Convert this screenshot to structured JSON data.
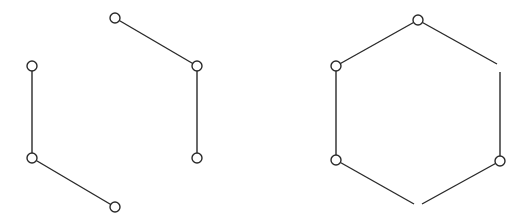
{
  "diagram": {
    "type": "graph",
    "stroke_color": "#2a2a2a",
    "node_radius": 5,
    "graphs": [
      {
        "name": "left-graph-three-disjoint-edges",
        "nodes": [
          {
            "id": "L1",
            "x": 115,
            "y": 18
          },
          {
            "id": "L2",
            "x": 197,
            "y": 66
          },
          {
            "id": "L3",
            "x": 197,
            "y": 158
          },
          {
            "id": "L4",
            "x": 115,
            "y": 207
          },
          {
            "id": "L5",
            "x": 32,
            "y": 158
          },
          {
            "id": "L6",
            "x": 32,
            "y": 66
          }
        ],
        "edges": [
          {
            "from": "L1",
            "to": "L2"
          },
          {
            "from": "L2",
            "to": "L3"
          },
          {
            "from": "L5",
            "to": "L4"
          },
          {
            "from": "L6",
            "to": "L5"
          }
        ]
      },
      {
        "name": "right-graph-hexagon-with-gaps",
        "nodes": [
          {
            "id": "R1",
            "x": 418,
            "y": 20
          },
          {
            "id": "R2",
            "x": 336,
            "y": 66
          },
          {
            "id": "R3",
            "x": 336,
            "y": 160
          },
          {
            "id": "R4",
            "x": 500,
            "y": 161
          }
        ],
        "segments": [
          {
            "x1": 418,
            "y1": 20,
            "x2": 336,
            "y2": 66
          },
          {
            "x1": 418,
            "y1": 20,
            "x2": 497,
            "y2": 64
          },
          {
            "x1": 336,
            "y1": 66,
            "x2": 336,
            "y2": 160
          },
          {
            "x1": 336,
            "y1": 160,
            "x2": 414,
            "y2": 204
          },
          {
            "x1": 500,
            "y1": 161,
            "x2": 422,
            "y2": 204
          },
          {
            "x1": 500,
            "y1": 161,
            "x2": 500,
            "y2": 72
          }
        ]
      }
    ]
  }
}
